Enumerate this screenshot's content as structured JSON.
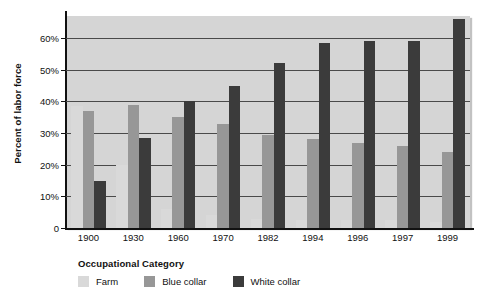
{
  "chart_data": {
    "type": "bar",
    "title": "",
    "xlabel": "",
    "ylabel": "Percent of labor force",
    "ylim": [
      0,
      67
    ],
    "grid": true,
    "legend_position": "bottom-left",
    "legend_title": "Occupational Category",
    "categories": [
      "1900",
      "1930",
      "1960",
      "1970",
      "1982",
      "1994",
      "1996",
      "1997",
      "1999"
    ],
    "ytick_labels": [
      "0",
      "10%",
      "20%",
      "30%",
      "40%",
      "50%",
      "60%"
    ],
    "ytick_values": [
      0,
      10,
      20,
      30,
      40,
      50,
      60
    ],
    "series": [
      {
        "name": "Farm",
        "color": "#d9d9d9",
        "values": [
          38.5,
          20.0,
          6.0,
          4.0,
          3.0,
          2.5,
          2.5,
          2.5,
          2.0
        ]
      },
      {
        "name": "Blue collar",
        "color": "#979797",
        "values": [
          37.0,
          39.0,
          35.0,
          33.0,
          29.5,
          28.0,
          27.0,
          26.0,
          24.0
        ]
      },
      {
        "name": "White collar",
        "color": "#3b3b3b",
        "values": [
          15.0,
          28.5,
          40.0,
          45.0,
          52.0,
          58.5,
          59.0,
          59.0,
          66.0
        ]
      }
    ]
  },
  "colors": {
    "plot_background": "#d5d5d5",
    "gridline": "#4a4a4a",
    "axis": "#111111",
    "page_background": "#ffffff"
  }
}
